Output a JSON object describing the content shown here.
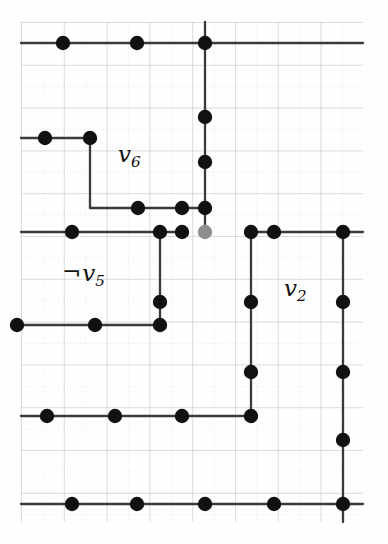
{
  "figure": {
    "kind": "lattice-graph-diagram",
    "caption_labels": [
      {
        "id": "label-v6",
        "text": "v6",
        "base": "v",
        "sub": "6",
        "neg": false,
        "x": 118,
        "y": 143,
        "size": 23
      },
      {
        "id": "label-v5",
        "text": "¬v5",
        "base": "v",
        "sub": "5",
        "neg": true,
        "x": 62,
        "y": 262,
        "size": 23
      },
      {
        "id": "label-v2",
        "text": "v2",
        "base": "v",
        "sub": "2",
        "neg": false,
        "x": 284,
        "y": 277,
        "size": 23
      }
    ],
    "negation_symbol": "¬",
    "colors": {
      "background": "#fefefe",
      "node_fill": "#111111",
      "node_faded_fill": "#8e8e8e",
      "edge": "#3a3a3a",
      "grid_minor": "#d8d8d8",
      "grid_major": "#bdbdbd"
    },
    "grid": {
      "x_start": 21,
      "x_end": 363,
      "y_start": 22,
      "y_end": 522,
      "minor_step": 21.4,
      "major_every": 2
    },
    "node_radius": 7.2,
    "nodes": [
      {
        "id": "n-r0-c1",
        "x": 63,
        "y": 43,
        "faded": false
      },
      {
        "id": "n-r0-c2",
        "x": 137,
        "y": 43,
        "faded": false
      },
      {
        "id": "n-r0-c3",
        "x": 205,
        "y": 43,
        "faded": false
      },
      {
        "id": "n-r1-c0",
        "x": 45,
        "y": 138,
        "faded": false
      },
      {
        "id": "n-r1-c1",
        "x": 90,
        "y": 138,
        "faded": false
      },
      {
        "id": "n-r2-c3",
        "x": 205,
        "y": 117,
        "faded": false
      },
      {
        "id": "n-r3-c3",
        "x": 205,
        "y": 162,
        "faded": false
      },
      {
        "id": "n-r4-c1",
        "x": 138,
        "y": 208,
        "faded": false
      },
      {
        "id": "n-r4-c2",
        "x": 182,
        "y": 208,
        "faded": false
      },
      {
        "id": "n-r4-c3",
        "x": 205,
        "y": 208,
        "faded": false
      },
      {
        "id": "n-r5-c1",
        "x": 72,
        "y": 232,
        "faded": false
      },
      {
        "id": "n-r5-c2",
        "x": 160,
        "y": 232,
        "faded": false
      },
      {
        "id": "n-r5-c3",
        "x": 182,
        "y": 232,
        "faded": false
      },
      {
        "id": "n-r5-faded",
        "x": 205,
        "y": 232,
        "faded": true
      },
      {
        "id": "n-r5-c5",
        "x": 251,
        "y": 232,
        "faded": false
      },
      {
        "id": "n-r5-c6",
        "x": 274,
        "y": 232,
        "faded": false
      },
      {
        "id": "n-r5-c7",
        "x": 343,
        "y": 232,
        "faded": false
      },
      {
        "id": "n-r6-c2",
        "x": 160,
        "y": 302,
        "faded": false
      },
      {
        "id": "n-r6-c5",
        "x": 251,
        "y": 302,
        "faded": false
      },
      {
        "id": "n-r6-c7",
        "x": 343,
        "y": 302,
        "faded": false
      },
      {
        "id": "n-r7-c0",
        "x": 17,
        "y": 325,
        "faded": false
      },
      {
        "id": "n-r7-c1",
        "x": 95,
        "y": 325,
        "faded": false
      },
      {
        "id": "n-r7-c2",
        "x": 160,
        "y": 325,
        "faded": false
      },
      {
        "id": "n-r8-c5",
        "x": 251,
        "y": 372,
        "faded": false
      },
      {
        "id": "n-r8-c7",
        "x": 343,
        "y": 372,
        "faded": false
      },
      {
        "id": "n-r9-c0",
        "x": 47,
        "y": 416,
        "faded": false
      },
      {
        "id": "n-r9-c1",
        "x": 115,
        "y": 416,
        "faded": false
      },
      {
        "id": "n-r9-c2",
        "x": 182,
        "y": 416,
        "faded": false
      },
      {
        "id": "n-r9-c5",
        "x": 251,
        "y": 416,
        "faded": false
      },
      {
        "id": "n-r10-c7",
        "x": 343,
        "y": 440,
        "faded": false
      },
      {
        "id": "n-r11-c1",
        "x": 72,
        "y": 504,
        "faded": false
      },
      {
        "id": "n-r11-c2",
        "x": 137,
        "y": 504,
        "faded": false
      },
      {
        "id": "n-r11-c3",
        "x": 205,
        "y": 504,
        "faded": false
      },
      {
        "id": "n-r11-c5",
        "x": 274,
        "y": 504,
        "faded": false
      },
      {
        "id": "n-r11-c7",
        "x": 343,
        "y": 504,
        "faded": false
      }
    ],
    "edges": [
      {
        "id": "e-top-row",
        "x1": 21,
        "y1": 43,
        "x2": 363,
        "y2": 43
      },
      {
        "id": "e-v-col3-top",
        "x1": 205,
        "y1": 22,
        "x2": 205,
        "y2": 232
      },
      {
        "id": "e-row1",
        "x1": 21,
        "y1": 138,
        "x2": 90,
        "y2": 138
      },
      {
        "id": "e-col1-down",
        "x1": 90,
        "y1": 138,
        "x2": 90,
        "y2": 208
      },
      {
        "id": "e-row4",
        "x1": 90,
        "y1": 208,
        "x2": 205,
        "y2": 208
      },
      {
        "id": "e-row5-left",
        "x1": 21,
        "y1": 232,
        "x2": 182,
        "y2": 232
      },
      {
        "id": "e-col-160-down",
        "x1": 160,
        "y1": 232,
        "x2": 160,
        "y2": 325
      },
      {
        "id": "e-row5-right",
        "x1": 251,
        "y1": 232,
        "x2": 363,
        "y2": 232
      },
      {
        "id": "e-col-251-down",
        "x1": 251,
        "y1": 232,
        "x2": 251,
        "y2": 416
      },
      {
        "id": "e-col-343-down",
        "x1": 343,
        "y1": 232,
        "x2": 343,
        "y2": 522
      },
      {
        "id": "e-row7",
        "x1": 17,
        "y1": 325,
        "x2": 160,
        "y2": 325
      },
      {
        "id": "e-row9",
        "x1": 21,
        "y1": 416,
        "x2": 251,
        "y2": 416
      },
      {
        "id": "e-bottom-row",
        "x1": 21,
        "y1": 504,
        "x2": 363,
        "y2": 504
      }
    ]
  }
}
